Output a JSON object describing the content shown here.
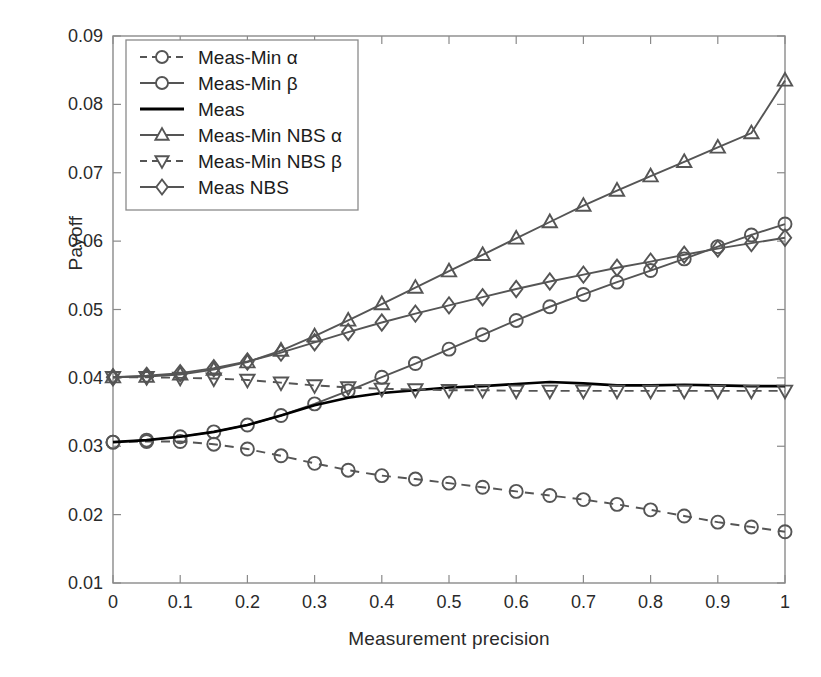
{
  "axes": {
    "ylabel": "Payoff",
    "xlabel": "Measurement precision",
    "xticks": [
      "0",
      "0.1",
      "0.2",
      "0.3",
      "0.4",
      "0.5",
      "0.6",
      "0.7",
      "0.8",
      "0.9",
      "1"
    ],
    "yticks": [
      "0.01",
      "0.02",
      "0.03",
      "0.04",
      "0.05",
      "0.06",
      "0.07",
      "0.08",
      "0.09"
    ],
    "xlim": [
      0,
      1
    ],
    "ylim": [
      0.01,
      0.09
    ],
    "box": true,
    "grid": false
  },
  "legend": {
    "position": "upper-left",
    "entries": [
      {
        "label": "Meas-Min α",
        "marker": "circle",
        "color": "#555555",
        "style": "dashed"
      },
      {
        "label": "Meas-Min β",
        "marker": "circle",
        "color": "#555555",
        "style": "solid"
      },
      {
        "label": "Meas",
        "marker": "none",
        "color": "#000000",
        "style": "solid"
      },
      {
        "label": "Meas-Min NBS α",
        "marker": "triangle-up",
        "color": "#555555",
        "style": "solid"
      },
      {
        "label": "Meas-Min NBS β",
        "marker": "triangle-down",
        "color": "#555555",
        "style": "dashed"
      },
      {
        "label": "Meas NBS",
        "marker": "diamond",
        "color": "#555555",
        "style": "solid"
      }
    ]
  },
  "chart_data": {
    "type": "line",
    "title": "",
    "xlabel": "Measurement precision",
    "ylabel": "Payoff",
    "xlim": [
      0,
      1
    ],
    "ylim": [
      0.01,
      0.09
    ],
    "grid": false,
    "legend_position": "upper-left",
    "x": [
      0,
      0.05,
      0.1,
      0.15,
      0.2,
      0.25,
      0.3,
      0.35,
      0.4,
      0.45,
      0.5,
      0.55,
      0.6,
      0.65,
      0.7,
      0.75,
      0.8,
      0.85,
      0.9,
      0.95,
      1
    ],
    "series": [
      {
        "name": "Meas-Min α",
        "marker": "circle",
        "color": "#555555",
        "style": "dashed",
        "values": [
          0.0306,
          0.0307,
          0.0307,
          0.0303,
          0.0296,
          0.0286,
          0.0275,
          0.0265,
          0.0257,
          0.0252,
          0.0246,
          0.024,
          0.0234,
          0.0228,
          0.0222,
          0.0215,
          0.0207,
          0.0198,
          0.0189,
          0.0182,
          0.0175
        ]
      },
      {
        "name": "Meas-Min β",
        "marker": "circle",
        "color": "#555555",
        "style": "solid",
        "values": [
          0.0306,
          0.0309,
          0.0314,
          0.0321,
          0.0331,
          0.0345,
          0.0362,
          0.0381,
          0.0401,
          0.0421,
          0.0442,
          0.0463,
          0.0484,
          0.0504,
          0.0522,
          0.054,
          0.0557,
          0.0574,
          0.0592,
          0.0609,
          0.0625
        ]
      },
      {
        "name": "Meas",
        "marker": "none",
        "color": "#000000",
        "style": "solid",
        "values": [
          0.0306,
          0.0309,
          0.0314,
          0.0321,
          0.0331,
          0.0345,
          0.036,
          0.0371,
          0.0378,
          0.0382,
          0.0386,
          0.0388,
          0.0391,
          0.0394,
          0.0392,
          0.0389,
          0.0389,
          0.039,
          0.0389,
          0.0388,
          0.0388
        ]
      },
      {
        "name": "Meas-Min NBS α",
        "marker": "triangle-up",
        "color": "#555555",
        "style": "solid",
        "values": [
          0.0401,
          0.0402,
          0.0405,
          0.0412,
          0.0423,
          0.044,
          0.0461,
          0.0484,
          0.0508,
          0.0532,
          0.0556,
          0.058,
          0.0604,
          0.0628,
          0.0652,
          0.0674,
          0.0695,
          0.0716,
          0.0737,
          0.0758,
          0.0835
        ]
      },
      {
        "name": "Meas-Min NBS β",
        "marker": "triangle-down",
        "color": "#555555",
        "style": "dashed",
        "values": [
          0.0401,
          0.0401,
          0.04,
          0.0399,
          0.0397,
          0.0393,
          0.0389,
          0.0386,
          0.0384,
          0.0383,
          0.0382,
          0.0382,
          0.0381,
          0.0381,
          0.0381,
          0.0381,
          0.0381,
          0.0381,
          0.0381,
          0.0381,
          0.0381
        ]
      },
      {
        "name": "Meas NBS",
        "marker": "diamond",
        "color": "#555555",
        "style": "solid",
        "values": [
          0.0401,
          0.0403,
          0.0407,
          0.0414,
          0.0424,
          0.0437,
          0.0452,
          0.0467,
          0.0481,
          0.0494,
          0.0506,
          0.0518,
          0.053,
          0.0541,
          0.0551,
          0.0561,
          0.057,
          0.058,
          0.0589,
          0.0597,
          0.0605
        ]
      }
    ]
  }
}
